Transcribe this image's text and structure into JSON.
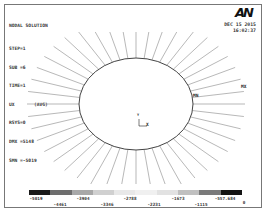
{
  "header": {
    "title": "NODAL SOLUTION",
    "lines": [
      "STEP=1",
      "SUB =6",
      "TIME=1",
      "UX       (AVG)",
      "RSYS=0",
      "DMX =5148",
      "SMN =-5019"
    ],
    "logo": "AN",
    "date": "DEC 15 2015",
    "time": "16:02:37"
  },
  "plot": {
    "markers": {
      "max": "MX",
      "min": "MN"
    },
    "triad": {
      "x": "X",
      "y": "Y",
      "z": "Z"
    }
  },
  "legend": {
    "colors": [
      "#1a1a1a",
      "#6e6e6e",
      "#a8a8a8",
      "#d0d0d0",
      "#e8e8e8",
      "#f0f0f0",
      "#e2e2e2",
      "#c0c0c0",
      "#7a7a7a",
      "#141414"
    ],
    "labels_top": [
      "-5019",
      "-3904",
      "-2788",
      "-1673",
      "-557.684"
    ],
    "labels_bottom": [
      "-4461",
      "-3346",
      "-2231",
      "-1115",
      "0"
    ]
  }
}
